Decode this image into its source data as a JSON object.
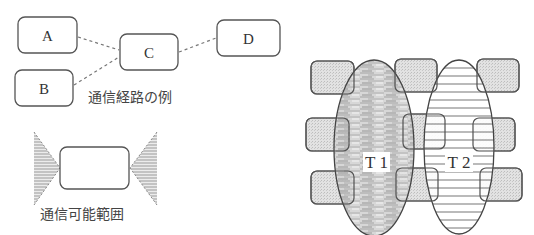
{
  "route_example": {
    "caption": "通信経路の例",
    "nodes": [
      {
        "id": "A",
        "label": "A"
      },
      {
        "id": "B",
        "label": "B"
      },
      {
        "id": "C",
        "label": "C"
      },
      {
        "id": "D",
        "label": "D"
      }
    ],
    "links": [
      [
        "A",
        "C"
      ],
      [
        "B",
        "C"
      ],
      [
        "C",
        "D"
      ]
    ]
  },
  "range_example": {
    "caption": "通信可能範囲"
  },
  "teams": [
    {
      "label": "T 1",
      "fill": "horizontal-streaks"
    },
    {
      "label": "T 2",
      "fill": "horizontal-lines"
    }
  ],
  "colors": {
    "stroke": "#555555",
    "box_fill_gray": "#dcdcdc",
    "hatch": "#888888"
  }
}
